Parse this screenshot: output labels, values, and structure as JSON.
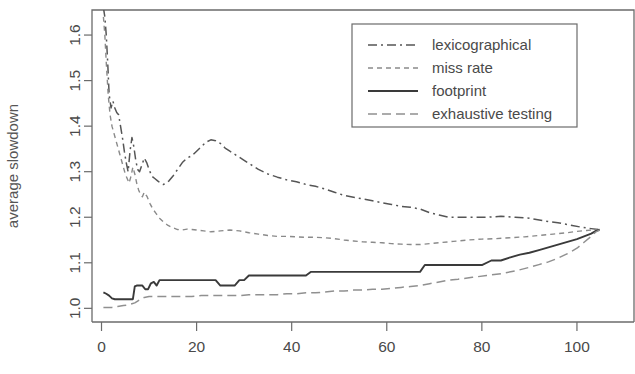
{
  "chart_data": {
    "type": "line",
    "title": "",
    "xlabel": "",
    "ylabel": "average slowdown",
    "xlim": [
      -2,
      112
    ],
    "ylim": [
      0.97,
      1.655
    ],
    "grid": false,
    "legend_position": "top-right",
    "xticks": [
      0,
      20,
      40,
      60,
      80,
      100
    ],
    "xtick_labels": [
      "0",
      "20",
      "40",
      "60",
      "80",
      "100"
    ],
    "yticks": [
      1.0,
      1.1,
      1.2,
      1.3,
      1.4,
      1.5,
      1.6
    ],
    "ytick_labels": [
      "1.0",
      "1.1",
      "1.2",
      "1.3",
      "1.4",
      "1.5",
      "1.6"
    ],
    "series": [
      {
        "name": "lexicographical",
        "style": "dashdot",
        "color": "#555555",
        "width": 1.5,
        "x": [
          0.4,
          0.7,
          1.0,
          1.3,
          1.6,
          2.0,
          2.4,
          2.8,
          3.2,
          3.6,
          4.0,
          4.4,
          4.8,
          5.2,
          5.6,
          6.0,
          6.4,
          6.8,
          7.2,
          7.6,
          8.0,
          8.5,
          9.0,
          9.5,
          10.0,
          10.6,
          11.2,
          11.8,
          12.4,
          13.0,
          13.6,
          14.2,
          15.0,
          16.0,
          17.0,
          18.0,
          19.0,
          20.0,
          21.0,
          22.0,
          23.0,
          24.0,
          25.0,
          26.0,
          27.0,
          28.5,
          30.0,
          31.5,
          33.0,
          35.0,
          37.0,
          39.0,
          41.0,
          43.0,
          45.0,
          47.0,
          49.0,
          51.0,
          53.0,
          55.0,
          57.0,
          59.0,
          61.0,
          63.0,
          65.0,
          67.0,
          69.0,
          71.0,
          73.0,
          75.0,
          78.0,
          81.0,
          84.0,
          87.0,
          90.0,
          93.0,
          96.0,
          99.0,
          101.0,
          103.0,
          104.5
        ],
        "y": [
          1.66,
          1.64,
          1.6,
          1.54,
          1.47,
          1.44,
          1.455,
          1.44,
          1.43,
          1.425,
          1.4,
          1.375,
          1.345,
          1.32,
          1.3,
          1.345,
          1.375,
          1.355,
          1.325,
          1.305,
          1.3,
          1.315,
          1.33,
          1.32,
          1.305,
          1.29,
          1.285,
          1.28,
          1.275,
          1.272,
          1.275,
          1.28,
          1.29,
          1.305,
          1.32,
          1.33,
          1.335,
          1.345,
          1.355,
          1.365,
          1.37,
          1.368,
          1.362,
          1.352,
          1.345,
          1.335,
          1.325,
          1.315,
          1.305,
          1.295,
          1.288,
          1.282,
          1.278,
          1.272,
          1.268,
          1.262,
          1.255,
          1.248,
          1.244,
          1.24,
          1.236,
          1.232,
          1.228,
          1.224,
          1.222,
          1.218,
          1.21,
          1.205,
          1.2,
          1.2,
          1.2,
          1.2,
          1.202,
          1.2,
          1.198,
          1.192,
          1.188,
          1.182,
          1.178,
          1.175,
          1.173
        ]
      },
      {
        "name": "miss rate",
        "style": "dotted",
        "color": "#8a8a8a",
        "width": 1.4,
        "x": [
          0.4,
          0.7,
          1.0,
          1.4,
          1.8,
          2.2,
          2.6,
          3.0,
          3.4,
          3.8,
          4.2,
          4.6,
          5.0,
          5.4,
          5.8,
          6.2,
          6.6,
          7.0,
          7.4,
          7.8,
          8.2,
          8.6,
          9.0,
          9.6,
          10.2,
          10.8,
          11.5,
          12.2,
          13.0,
          14.0,
          15.0,
          16.0,
          17.0,
          18.0,
          19.0,
          20.0,
          21.5,
          23.0,
          25.0,
          27.0,
          29.0,
          31.0,
          33.0,
          35.0,
          37.0,
          39.0,
          41.0,
          43.0,
          45.0,
          47.0,
          49.0,
          51.0,
          53.0,
          55.0,
          57.0,
          59.0,
          61.0,
          63.0,
          65.0,
          67.0,
          69.0,
          71.0,
          74.0,
          77.0,
          80.0,
          83.0,
          86.0,
          89.0,
          92.0,
          95.0,
          98.0,
          100.0,
          102.0,
          103.5,
          104.5
        ],
        "y": [
          1.64,
          1.6,
          1.54,
          1.47,
          1.425,
          1.4,
          1.385,
          1.37,
          1.355,
          1.34,
          1.325,
          1.31,
          1.295,
          1.285,
          1.275,
          1.29,
          1.31,
          1.295,
          1.275,
          1.26,
          1.25,
          1.245,
          1.255,
          1.245,
          1.23,
          1.218,
          1.208,
          1.198,
          1.19,
          1.182,
          1.177,
          1.173,
          1.172,
          1.174,
          1.173,
          1.172,
          1.17,
          1.168,
          1.17,
          1.172,
          1.17,
          1.166,
          1.163,
          1.16,
          1.158,
          1.158,
          1.157,
          1.156,
          1.156,
          1.155,
          1.153,
          1.15,
          1.148,
          1.146,
          1.145,
          1.144,
          1.142,
          1.141,
          1.14,
          1.14,
          1.142,
          1.144,
          1.147,
          1.15,
          1.152,
          1.153,
          1.155,
          1.157,
          1.16,
          1.163,
          1.166,
          1.169,
          1.171,
          1.172,
          1.173
        ]
      },
      {
        "name": "footprint",
        "style": "solid",
        "color": "#3a3a3a",
        "width": 1.9,
        "x": [
          0.4,
          1.0,
          1.6,
          2.2,
          2.8,
          3.2,
          3.6,
          4.2,
          4.8,
          5.4,
          6.0,
          6.6,
          7.0,
          7.4,
          8.0,
          8.6,
          9.2,
          9.8,
          10.4,
          11.0,
          11.6,
          12.2,
          12.8,
          13.4,
          14.0,
          15.0,
          16.0,
          17.0,
          18.0,
          19.0,
          20.0,
          21.0,
          22.0,
          23.0,
          24.0,
          25.0,
          26.0,
          27.0,
          28.0,
          29.0,
          30.0,
          31.0,
          32.0,
          33.0,
          35.0,
          37.0,
          39.0,
          41.0,
          43.0,
          44.0,
          45.0,
          47.0,
          50.0,
          53.0,
          56.0,
          59.0,
          62.0,
          65.0,
          67.0,
          68.0,
          69.0,
          71.0,
          74.0,
          77.0,
          80.0,
          82.0,
          84.0,
          86.0,
          88.0,
          90.0,
          92.0,
          94.0,
          96.0,
          98.0,
          100.0,
          101.5,
          103.0,
          104.0,
          104.8
        ],
        "y": [
          1.035,
          1.032,
          1.028,
          1.022,
          1.02,
          1.02,
          1.02,
          1.02,
          1.02,
          1.02,
          1.02,
          1.02,
          1.048,
          1.05,
          1.05,
          1.05,
          1.042,
          1.042,
          1.055,
          1.058,
          1.05,
          1.062,
          1.062,
          1.062,
          1.062,
          1.062,
          1.062,
          1.062,
          1.062,
          1.062,
          1.062,
          1.062,
          1.062,
          1.062,
          1.062,
          1.05,
          1.05,
          1.05,
          1.05,
          1.062,
          1.062,
          1.072,
          1.072,
          1.072,
          1.072,
          1.072,
          1.072,
          1.072,
          1.072,
          1.08,
          1.08,
          1.08,
          1.08,
          1.08,
          1.08,
          1.08,
          1.08,
          1.08,
          1.08,
          1.095,
          1.095,
          1.095,
          1.095,
          1.095,
          1.095,
          1.105,
          1.105,
          1.112,
          1.118,
          1.122,
          1.128,
          1.134,
          1.14,
          1.146,
          1.152,
          1.158,
          1.164,
          1.17,
          1.173
        ]
      },
      {
        "name": "exhaustive testing",
        "style": "dashed",
        "color": "#909090",
        "width": 1.5,
        "x": [
          0.4,
          1.0,
          1.6,
          2.2,
          2.8,
          3.4,
          4.0,
          4.6,
          5.2,
          5.8,
          6.4,
          7.0,
          7.6,
          8.2,
          9.0,
          10.0,
          11.0,
          12.0,
          13.0,
          14.0,
          15.0,
          17.0,
          19.0,
          21.0,
          23.0,
          25.0,
          27.0,
          29.0,
          31.0,
          33.0,
          35.0,
          37.0,
          39.0,
          41.0,
          43.0,
          45.0,
          47.0,
          49.0,
          51.0,
          53.0,
          55.0,
          57.0,
          59.0,
          61.0,
          63.0,
          65.0,
          67.0,
          69.0,
          71.0,
          73.0,
          75.0,
          78.0,
          81.0,
          84.0,
          87.0,
          90.0,
          92.0,
          94.0,
          96.0,
          98.0,
          100.0,
          101.5,
          103.0,
          104.0,
          104.8
        ],
        "y": [
          1.002,
          1.002,
          1.002,
          1.002,
          1.003,
          1.004,
          1.005,
          1.006,
          1.007,
          1.008,
          1.01,
          1.012,
          1.016,
          1.02,
          1.024,
          1.026,
          1.026,
          1.026,
          1.026,
          1.026,
          1.026,
          1.026,
          1.026,
          1.028,
          1.028,
          1.028,
          1.028,
          1.028,
          1.03,
          1.03,
          1.03,
          1.03,
          1.032,
          1.032,
          1.034,
          1.034,
          1.036,
          1.038,
          1.038,
          1.04,
          1.04,
          1.042,
          1.042,
          1.044,
          1.046,
          1.048,
          1.05,
          1.054,
          1.058,
          1.062,
          1.064,
          1.068,
          1.072,
          1.076,
          1.082,
          1.09,
          1.096,
          1.102,
          1.11,
          1.12,
          1.132,
          1.145,
          1.158,
          1.168,
          1.172
        ]
      }
    ]
  },
  "legend": {
    "items": [
      {
        "label": "lexicographical"
      },
      {
        "label": "miss rate"
      },
      {
        "label": "footprint"
      },
      {
        "label": "exhaustive testing"
      }
    ]
  }
}
